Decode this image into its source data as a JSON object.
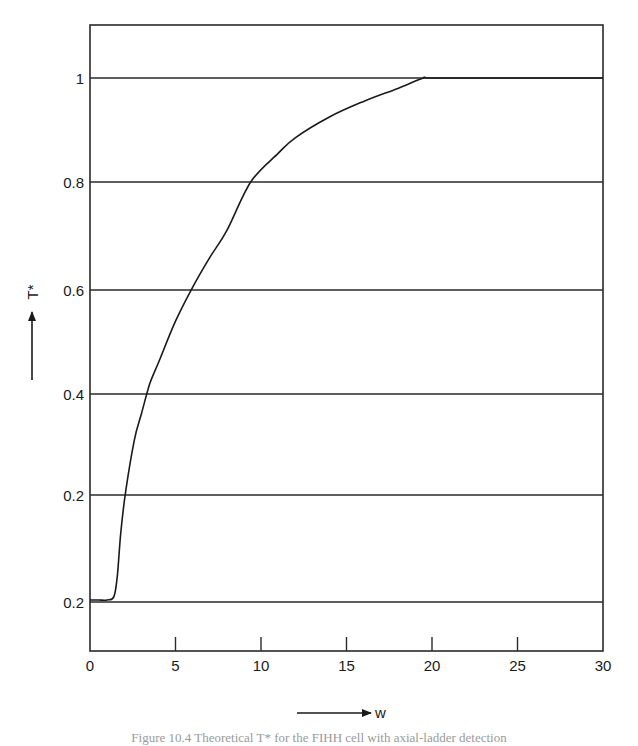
{
  "chart_data": {
    "type": "line",
    "title": "",
    "xlabel": "w",
    "ylabel": "T*",
    "xlim": [
      0,
      30
    ],
    "x_ticks": [
      0,
      5,
      10,
      15,
      20,
      25,
      30
    ],
    "y_tick_labels": [
      {
        "label": "1",
        "value": 1.0
      },
      {
        "label": "0.8",
        "value": 0.8
      },
      {
        "label": "0.6",
        "value": 0.6
      },
      {
        "label": "0.4",
        "value": 0.4
      },
      {
        "label": "0.2",
        "value": 0.2
      },
      {
        "label": "0.2",
        "value": 0.0
      }
    ],
    "grid": "horizontal at each y tick",
    "legend": "none",
    "series": [
      {
        "name": "T*",
        "x": [
          0,
          0.5,
          1.0,
          1.4,
          1.6,
          1.8,
          2.1,
          2.6,
          3.0,
          3.5,
          4.0,
          5.0,
          6.0,
          7.0,
          8.0,
          9.4,
          11.0,
          12.0,
          14.0,
          16.0,
          18.0,
          19.5,
          20.0,
          25.0,
          30.0
        ],
        "values": [
          0.0,
          0.0,
          0.0,
          0.01,
          0.05,
          0.13,
          0.21,
          0.31,
          0.36,
          0.42,
          0.46,
          0.54,
          0.605,
          0.66,
          0.71,
          0.8,
          0.855,
          0.885,
          0.925,
          0.955,
          0.98,
          1.0,
          1.0,
          1.0,
          1.0
        ]
      }
    ]
  },
  "axis": {
    "x_ticks": [
      "0",
      "5",
      "10",
      "15",
      "20",
      "25",
      "30"
    ],
    "y_ticks": [
      "1",
      "0.8",
      "0.6",
      "0.4",
      "0.2",
      "0.2"
    ],
    "x_label": "w",
    "y_label": "T*"
  },
  "caption": "Figure 10.4  Theoretical T* for the FIHH cell with axial-ladder detection"
}
